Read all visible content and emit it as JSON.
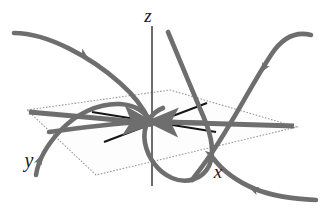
{
  "figure": {
    "width": 329,
    "height": 220,
    "background_color": "#ffffff"
  },
  "axes": {
    "z": {
      "label": "z",
      "label_x": 148,
      "label_y": 22,
      "line": {
        "x1": 152,
        "y1": 26,
        "x2": 152,
        "y2": 186
      },
      "color": "#3d3d3d"
    },
    "x": {
      "label": "x",
      "label_x": 218,
      "label_y": 178,
      "color": "#1a1a1a"
    },
    "y": {
      "label": "y",
      "label_x": 29,
      "label_y": 167,
      "color": "#1a1a1a"
    }
  },
  "origin": {
    "cx": 150,
    "cy": 122,
    "r": 5,
    "color": "#6e6e6e"
  },
  "plane": {
    "name": "invariant-plane",
    "vertices": [
      [
        27,
        110
      ],
      [
        170,
        90
      ],
      [
        297,
        127
      ],
      [
        96,
        175
      ]
    ],
    "stroke": "#9a9a9a",
    "fill": "#fdfdfd",
    "dash": "1.6 1.6"
  },
  "in_plane_lines": {
    "color": "#151515",
    "width": 2.0,
    "segments": [
      {
        "name": "line-a",
        "x1": 92,
        "y1": 112,
        "x2": 216,
        "y2": 132
      },
      {
        "name": "line-b",
        "x1": 104,
        "y1": 142,
        "x2": 207,
        "y2": 103
      }
    ]
  },
  "plane_arrows": {
    "color": "#6e6e6e",
    "width": 5.2,
    "items": [
      {
        "name": "plane-arrow-left",
        "x1": 29,
        "y1": 112,
        "x2": 142,
        "y2": 122,
        "head": "toward-origin"
      },
      {
        "name": "plane-arrow-right",
        "x1": 294,
        "y1": 126,
        "x2": 160,
        "y2": 122,
        "head": "toward-origin"
      },
      {
        "name": "plane-arrow-inner-right",
        "x1": 200,
        "y1": 123,
        "x2": 162,
        "y2": 122,
        "head": "toward-origin"
      }
    ]
  },
  "trajectories": {
    "color": "#6e6e6e",
    "width": 4.6,
    "items": [
      {
        "name": "trajectory-upper-left",
        "path": "M 14,33 C 48,33 92,58 120,83 C 136,97 145,111 150,122",
        "arrow": {
          "x": 80,
          "y": 52,
          "angle": 33
        }
      },
      {
        "name": "trajectory-upper-right",
        "path": "M 311,35 C 295,31 282,38 271,55 C 252,84 235,118 215,148 C 206,162 198,172 192,180",
        "arrow": {
          "x": 268,
          "y": 62,
          "angle": 118
        }
      },
      {
        "name": "trajectory-upper-middle",
        "path": "M 168,32 C 179,58 192,90 204,118 C 212,137 215,153 209,166 C 202,180 186,184 172,178 C 158,172 148,158 145,143 C 142,127 150,113 163,108",
        "arrow": {
          "x": 208,
          "y": 150,
          "angle": 86
        }
      },
      {
        "name": "trajectory-lower-left-spiral",
        "path": "M 36,175 C 38,162 46,146 60,131 C 76,114 98,103 120,104 C 136,105 147,113 150,122",
        "arrow": {
          "x": 39,
          "y": 162,
          "angle": -75
        }
      },
      {
        "name": "trajectory-lower-right",
        "path": "M 316,200 C 294,199 272,196 255,189 C 236,181 222,170 213,158",
        "arrow": {
          "x": 253,
          "y": 188,
          "angle": 198
        }
      },
      {
        "name": "trajectory-plane-tangent",
        "path": "M 49,132 C 78,128 110,124 140,122",
        "arrow": null
      }
    ]
  },
  "caption": ""
}
